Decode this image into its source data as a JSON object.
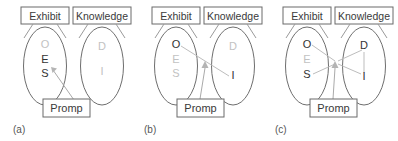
{
  "figure": {
    "name": "exhibit-knowledge-prompt-diagram",
    "panel_count": 3,
    "colors": {
      "active_node": "#333333",
      "inactive_node": "#c2c2c2",
      "shape_outline": "#6e6e6e",
      "link": "#bdbdbd",
      "background": "#ffffff"
    }
  },
  "labels": {
    "exhibit": "Exhibit",
    "knowledge": "Knowledge",
    "prompt": "Promp"
  },
  "panels": [
    {
      "id": "a",
      "caption": "(a)",
      "exhibit_label": "Exhibit",
      "knowledge_label": "Knowledge",
      "prompt_label": "Promp",
      "exhibit_nodes": [
        {
          "letter": "O",
          "state": "inactive"
        },
        {
          "letter": "E",
          "state": "active"
        },
        {
          "letter": "S",
          "state": "active"
        }
      ],
      "knowledge_nodes": [
        {
          "letter": "D",
          "state": "inactive"
        },
        {
          "letter": "I",
          "state": "inactive"
        }
      ],
      "links": [],
      "prompt_arrow_target": "exhibit-E-S"
    },
    {
      "id": "b",
      "caption": "(b)",
      "exhibit_label": "Exhibit",
      "knowledge_label": "Knowledge",
      "prompt_label": "Promp",
      "exhibit_nodes": [
        {
          "letter": "O",
          "state": "active"
        },
        {
          "letter": "E",
          "state": "inactive"
        },
        {
          "letter": "S",
          "state": "inactive"
        }
      ],
      "knowledge_nodes": [
        {
          "letter": "D",
          "state": "inactive"
        },
        {
          "letter": "I",
          "state": "active"
        }
      ],
      "links": [
        {
          "from": "O",
          "to": "I"
        }
      ],
      "prompt_arrow_target": "center-junction"
    },
    {
      "id": "c",
      "caption": "(c)",
      "exhibit_label": "Exhibit",
      "knowledge_label": "Knowledge",
      "prompt_label": "Promp",
      "exhibit_nodes": [
        {
          "letter": "O",
          "state": "active"
        },
        {
          "letter": "E",
          "state": "inactive"
        },
        {
          "letter": "S",
          "state": "active"
        }
      ],
      "knowledge_nodes": [
        {
          "letter": "D",
          "state": "active"
        },
        {
          "letter": "I",
          "state": "active"
        }
      ],
      "links": [
        {
          "from": "O",
          "to": "junction"
        },
        {
          "from": "S",
          "to": "junction"
        },
        {
          "from": "junction",
          "to": "D"
        },
        {
          "from": "junction",
          "to": "I"
        },
        {
          "from": "D",
          "to": "I"
        }
      ],
      "prompt_arrow_target": "center-junction"
    }
  ]
}
